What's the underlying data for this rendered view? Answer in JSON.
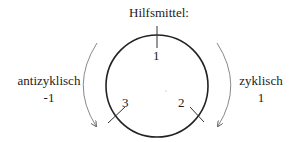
{
  "title": "Hilfsmittel:",
  "positions": [
    "1",
    "2",
    "3"
  ],
  "left": {
    "label": "antizyklisch",
    "value": "-1"
  },
  "right": {
    "label": "zyklisch",
    "value": "1"
  },
  "colors": {
    "circle": "#222222",
    "arrow": "#888888"
  }
}
